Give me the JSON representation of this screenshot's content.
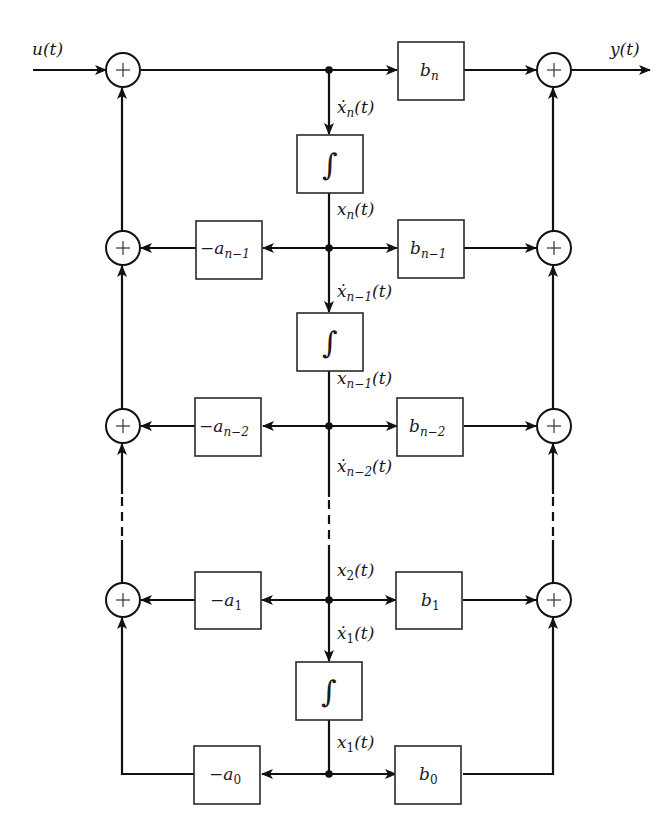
{
  "diagram": {
    "type": "block-diagram",
    "input_label": "u(t)",
    "output_label": "y(t)",
    "summing_symbol": "+",
    "integrator_symbol": "∫",
    "gain_blocks": {
      "feedforward": [
        {
          "base": "b",
          "sub": "n"
        },
        {
          "base": "b",
          "sub": "n−1"
        },
        {
          "base": "b",
          "sub": "n−2"
        },
        {
          "base": "b",
          "sub": "1"
        },
        {
          "base": "b",
          "sub": "0"
        }
      ],
      "feedback": [
        {
          "base": "−a",
          "sub": "n−1"
        },
        {
          "base": "−a",
          "sub": "n−2"
        },
        {
          "base": "−a",
          "sub": "1"
        },
        {
          "base": "−a",
          "sub": "0"
        }
      ]
    },
    "signal_labels": {
      "xdot_n": {
        "base": "ẋ",
        "sub": "n",
        "tail": "(t)"
      },
      "x_n": {
        "base": "x",
        "sub": "n",
        "tail": "(t)"
      },
      "xdot_n_1": {
        "base": "ẋ",
        "sub": "n−1",
        "tail": "(t)"
      },
      "x_n_1": {
        "base": "x",
        "sub": "n−1",
        "tail": "(t)"
      },
      "xdot_n_2": {
        "base": "ẋ",
        "sub": "n−2",
        "tail": "(t)"
      },
      "x_2": {
        "base": "x",
        "sub": "2",
        "tail": "(t)"
      },
      "xdot_1": {
        "base": "ẋ",
        "sub": "1",
        "tail": "(t)"
      },
      "x_1": {
        "base": "x",
        "sub": "1",
        "tail": "(t)"
      }
    }
  }
}
